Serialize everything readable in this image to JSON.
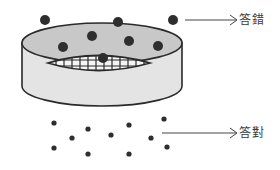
{
  "diagram": {
    "type": "sieve-filter-illustration",
    "colors": {
      "outline": "#2a2a2a",
      "sieve_top_fill": "#c8c8c8",
      "sieve_side_fill": "#e4e4e4",
      "mesh_fill": "#f4f4f4",
      "dot": "#2e2e2e",
      "arrow": "#444444",
      "text": "#3a3a3a"
    },
    "labels": {
      "wrong": "答錯",
      "right": "答對"
    },
    "large_dots": [
      {
        "x": 45,
        "y": 20
      },
      {
        "x": 118,
        "y": 22
      },
      {
        "x": 173,
        "y": 20
      },
      {
        "x": 92,
        "y": 36
      },
      {
        "x": 63,
        "y": 47
      },
      {
        "x": 129,
        "y": 41
      },
      {
        "x": 158,
        "y": 46
      },
      {
        "x": 103,
        "y": 58
      }
    ],
    "small_dots": [
      {
        "x": 54,
        "y": 123
      },
      {
        "x": 88,
        "y": 129
      },
      {
        "x": 129,
        "y": 125
      },
      {
        "x": 164,
        "y": 119
      },
      {
        "x": 72,
        "y": 138
      },
      {
        "x": 111,
        "y": 135
      },
      {
        "x": 151,
        "y": 138
      },
      {
        "x": 54,
        "y": 148
      },
      {
        "x": 88,
        "y": 154
      },
      {
        "x": 129,
        "y": 154
      },
      {
        "x": 167,
        "y": 147
      }
    ]
  }
}
